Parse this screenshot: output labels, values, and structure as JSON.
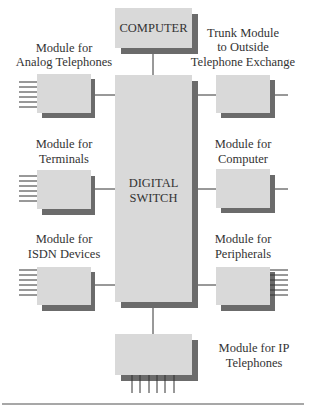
{
  "diagram": {
    "center": {
      "label_lines": [
        "DIGITAL",
        "SWITCH"
      ]
    },
    "top": {
      "label": "COMPUTER"
    },
    "modules": {
      "analog_telephones": {
        "label_lines": [
          "Module for",
          "Analog Telephones"
        ]
      },
      "terminals": {
        "label_lines": [
          "Module for",
          "Terminals"
        ]
      },
      "isdn_devices": {
        "label_lines": [
          "Module for",
          "ISDN Devices"
        ]
      },
      "trunk": {
        "label_lines": [
          "Trunk Module",
          "to Outside",
          "Telephone Exchange"
        ]
      },
      "computer": {
        "label_lines": [
          "Module for",
          "Computer"
        ]
      },
      "peripherals": {
        "label_lines": [
          "Module for",
          "Peripherals"
        ]
      },
      "ip_telephones": {
        "label_lines": [
          "Module for IP",
          "Telephones"
        ]
      }
    },
    "colors": {
      "box": "#d9d9d9",
      "shadow": "#6b6b6b",
      "line": "#333333",
      "text": "#333333"
    }
  }
}
